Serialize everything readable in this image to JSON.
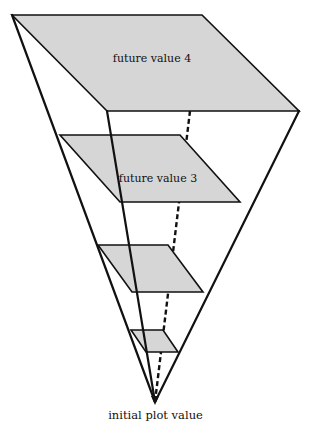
{
  "diagram": {
    "planes": [
      {
        "label": "future value 4"
      },
      {
        "label": "future value 3"
      },
      {
        "label": ""
      },
      {
        "label": ""
      }
    ],
    "apex_label": "initial plot value"
  },
  "colors": {
    "plane_fill": "#d6d6d6",
    "line": "#111111",
    "background": "#ffffff"
  }
}
